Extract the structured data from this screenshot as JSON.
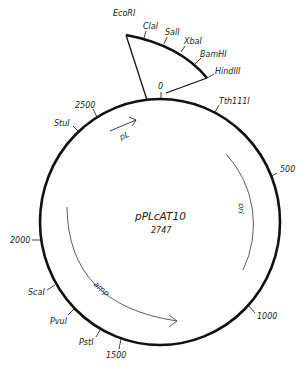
{
  "plasmid": {
    "name": "pPLcAT10",
    "size": "2747"
  },
  "insert_sites": [
    "EcoRI",
    "ClaI",
    "SalI",
    "XbaI",
    "BamHI",
    "HindIII"
  ],
  "sites": {
    "tth": "Tth111I",
    "stu": "StuI",
    "sca": "ScaI",
    "pvu": "PvuI",
    "pst": "PstI"
  },
  "scale": {
    "zero": "0",
    "s500": "500",
    "s1000": "1000",
    "s1500": "1500",
    "s2000": "2000",
    "s2500": "2500"
  },
  "features": {
    "pl": "pL",
    "ori": "ori",
    "amp": "amp"
  },
  "colors": {
    "line": "#111111",
    "text": "#222222"
  }
}
